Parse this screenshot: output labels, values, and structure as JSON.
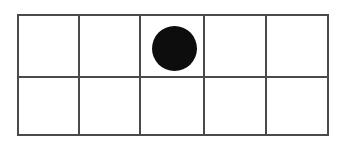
{
  "figure": {
    "name": "grid-with-filled-circle",
    "background_color": "#ffffff",
    "line_color": "#4a4a4a",
    "line_width_px": 2,
    "frame": {
      "x": 17,
      "y": 14,
      "width": 312,
      "height": 122
    }
  },
  "grid": {
    "rows": 2,
    "columns": 5,
    "column_edges_px": [
      17,
      78,
      139,
      203,
      265,
      329
    ],
    "row_edges_px": [
      14,
      76,
      136
    ],
    "cells": [
      {
        "row": 1,
        "column": 1,
        "content": ""
      },
      {
        "row": 1,
        "column": 2,
        "content": ""
      },
      {
        "row": 1,
        "column": 3,
        "content": "filled-circle"
      },
      {
        "row": 1,
        "column": 4,
        "content": ""
      },
      {
        "row": 1,
        "column": 5,
        "content": ""
      },
      {
        "row": 2,
        "column": 1,
        "content": ""
      },
      {
        "row": 2,
        "column": 2,
        "content": ""
      },
      {
        "row": 2,
        "column": 3,
        "content": ""
      },
      {
        "row": 2,
        "column": 4,
        "content": ""
      },
      {
        "row": 2,
        "column": 5,
        "content": ""
      }
    ]
  },
  "markers": [
    {
      "shape": "circle",
      "fill": "#0d0d0d",
      "center_x": 174,
      "center_y": 48,
      "diameter": 45,
      "row": 1,
      "column": 3
    }
  ]
}
